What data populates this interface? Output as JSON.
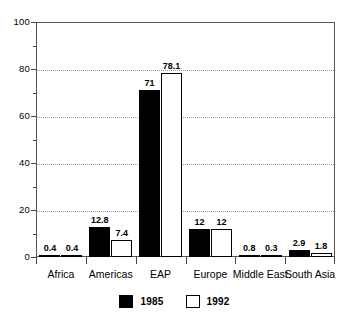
{
  "chart_data": {
    "type": "bar",
    "title": "",
    "subtitle": "",
    "xlabel": "",
    "ylabel": "",
    "ylim": [
      0,
      100
    ],
    "yticks": [
      0,
      20,
      40,
      60,
      80,
      100
    ],
    "ytick_labels": [
      "0",
      "20",
      "40",
      "60",
      "80",
      "100"
    ],
    "yminor_ticks": [
      10,
      30,
      50,
      70,
      90
    ],
    "grid": "horizontal-dotted-at-major-ticks",
    "legend_position": "bottom-center",
    "categories": [
      "Africa",
      "Americas",
      "EAP",
      "Europe",
      "Middle East",
      "South Asia"
    ],
    "series": [
      {
        "name": "1985",
        "color": "#000000",
        "fill": "solid-black",
        "values": [
          0.4,
          12.8,
          71,
          12,
          0.8,
          2.9
        ],
        "labels": [
          "0.4",
          "12.8",
          "71",
          "12",
          "0.8",
          "2.9"
        ]
      },
      {
        "name": "1992",
        "color": "#ffffff",
        "fill": "white-with-black-outline",
        "values": [
          0.4,
          7.4,
          78.1,
          12,
          0.3,
          1.8
        ],
        "labels": [
          "0.4",
          "7.4",
          "78.1",
          "12",
          "0.3",
          "1.8"
        ]
      }
    ]
  },
  "legend": {
    "entries": [
      {
        "label": "1985",
        "swatch": "filled-black-square"
      },
      {
        "label": "1992",
        "swatch": "outlined-white-square"
      }
    ]
  },
  "colors": {
    "series_1985": "#000000",
    "series_1992": "#ffffff",
    "axis": "#555555",
    "grid": "#9a9a9a",
    "background": "#ffffff"
  }
}
